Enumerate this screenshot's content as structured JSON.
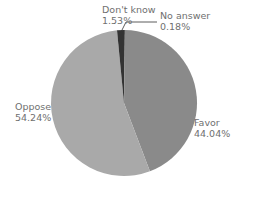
{
  "chart_data": {
    "type": "pie",
    "title": "",
    "categories": [
      "No answer",
      "Favor",
      "Oppose",
      "Don't know"
    ],
    "values": [
      0.18,
      44.04,
      54.24,
      1.53
    ],
    "unit": "%",
    "start_angle": "12 o'clock",
    "direction": "clockwise",
    "colors": [
      "#222222",
      "#8a8a8a",
      "#a9a9a9",
      "#333333"
    ],
    "legend": "none (direct labels)"
  },
  "labels": {
    "dont_know": {
      "name": "Don't know",
      "value": "1.53%"
    },
    "no_answer": {
      "name": "No answer",
      "value": "0.18%"
    },
    "oppose": {
      "name": "Oppose",
      "value": "54.24%"
    },
    "favor": {
      "name": "Favor",
      "value": "44.04%"
    }
  }
}
